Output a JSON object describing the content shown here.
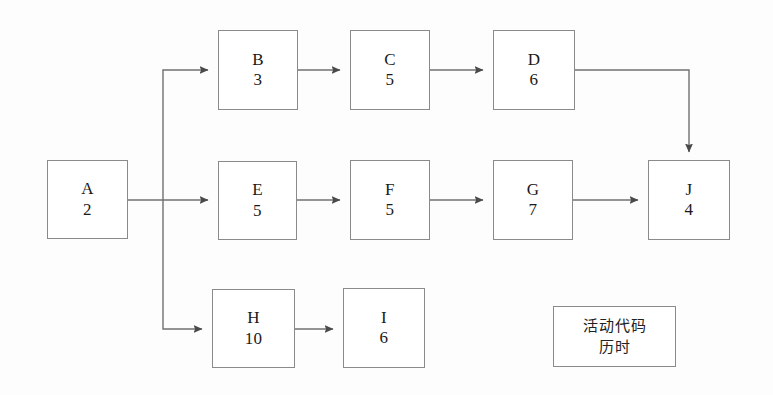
{
  "diagram": {
    "type": "activity-on-node-network",
    "title": "",
    "background_color": "#fdfdfd",
    "line_color": "#707070",
    "box_border_color": "#8a8a8a",
    "nodes": [
      {
        "id": "A",
        "code": "A",
        "duration": "2",
        "x": 47,
        "y": 160,
        "w": 81,
        "h": 79
      },
      {
        "id": "B",
        "code": "B",
        "duration": "3",
        "x": 218,
        "y": 30,
        "w": 80,
        "h": 80
      },
      {
        "id": "C",
        "code": "C",
        "duration": "5",
        "x": 350,
        "y": 30,
        "w": 80,
        "h": 80
      },
      {
        "id": "D",
        "code": "D",
        "duration": "6",
        "x": 493,
        "y": 30,
        "w": 82,
        "h": 80
      },
      {
        "id": "E",
        "code": "E",
        "duration": "5",
        "x": 218,
        "y": 161,
        "w": 79,
        "h": 79
      },
      {
        "id": "F",
        "code": "F",
        "duration": "5",
        "x": 350,
        "y": 160,
        "w": 80,
        "h": 80
      },
      {
        "id": "G",
        "code": "G",
        "duration": "7",
        "x": 493,
        "y": 160,
        "w": 80,
        "h": 80
      },
      {
        "id": "J",
        "code": "J",
        "duration": "4",
        "x": 648,
        "y": 160,
        "w": 82,
        "h": 80
      },
      {
        "id": "H",
        "code": "H",
        "duration": "10",
        "x": 212,
        "y": 289,
        "w": 83,
        "h": 79
      },
      {
        "id": "I",
        "code": "I",
        "duration": "6",
        "x": 343,
        "y": 288,
        "w": 82,
        "h": 80
      }
    ],
    "edges": [
      {
        "from": "A",
        "to": "B",
        "path": "M128,200 L163,200 M163,200 L163,70 L211,70",
        "arrow_at": [
          211,
          70
        ]
      },
      {
        "from": "A",
        "to": "E",
        "path": "M163,200 L211,200",
        "arrow_at": [
          211,
          200
        ]
      },
      {
        "from": "A",
        "to": "H",
        "path": "M163,200 L163,329 L205,329",
        "arrow_at": [
          205,
          329
        ]
      },
      {
        "from": "B",
        "to": "C",
        "path": "M298,70 L343,70",
        "arrow_at": [
          343,
          70
        ]
      },
      {
        "from": "C",
        "to": "D",
        "path": "M430,70 L486,70",
        "arrow_at": [
          486,
          70
        ]
      },
      {
        "from": "D",
        "to": "J",
        "path": "M575,70 L689,70 L689,153",
        "arrow_at": [
          689,
          153
        ]
      },
      {
        "from": "E",
        "to": "F",
        "path": "M297,200 L343,200",
        "arrow_at": [
          343,
          200
        ]
      },
      {
        "from": "F",
        "to": "G",
        "path": "M430,200 L486,200",
        "arrow_at": [
          486,
          200
        ]
      },
      {
        "from": "G",
        "to": "J",
        "path": "M573,200 L641,200",
        "arrow_at": [
          641,
          200
        ]
      },
      {
        "from": "H",
        "to": "I",
        "path": "M295,329 L336,329",
        "arrow_at": [
          336,
          329
        ]
      }
    ],
    "legend": {
      "x": 553,
      "y": 306,
      "w": 123,
      "h": 61,
      "lines": [
        "活动代码",
        "历时"
      ]
    }
  }
}
